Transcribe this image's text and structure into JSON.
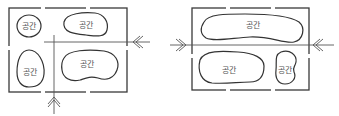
{
  "diagrams": [
    {
      "id": "left",
      "spaces": [
        {
          "label": "공간"
        },
        {
          "label": "공간"
        },
        {
          "label": "공간"
        },
        {
          "label": "공간"
        }
      ],
      "entrances": [
        "right",
        "bottom"
      ]
    },
    {
      "id": "right",
      "spaces": [
        {
          "label": "공간"
        },
        {
          "label": "공간"
        },
        {
          "label": "공간"
        }
      ],
      "entrances": [
        "left",
        "right"
      ]
    }
  ],
  "colors": {
    "line": "#3a3a3a",
    "background": "#ffffff"
  }
}
